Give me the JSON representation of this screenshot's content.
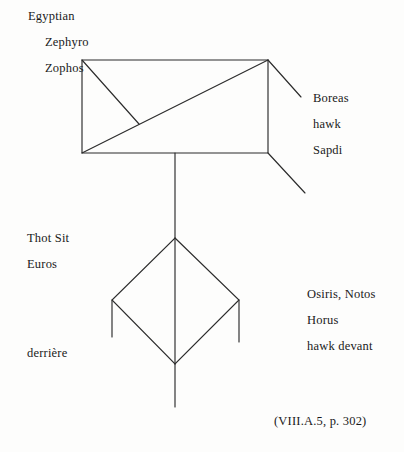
{
  "page": {
    "background_color": "#fdfdfc",
    "ink_color": "#2b2b2b",
    "text_color": "#1a1a1a"
  },
  "labels": {
    "top_left": [
      {
        "text": "Egyptian",
        "x": 28,
        "y": 10
      },
      {
        "text": "Zephyro",
        "x": 45,
        "y": 36
      },
      {
        "text": "Zophos",
        "x": 45,
        "y": 62
      }
    ],
    "right_upper": [
      {
        "text": "Boreas",
        "x": 313,
        "y": 92
      },
      {
        "text": "hawk",
        "x": 313,
        "y": 118
      },
      {
        "text": "Sapdi",
        "x": 313,
        "y": 144
      }
    ],
    "left_lower": [
      {
        "text": "Thot Sit",
        "x": 27,
        "y": 232
      },
      {
        "text": "Euros",
        "x": 27,
        "y": 258
      }
    ],
    "right_lower": [
      {
        "text": "Osiris, Notos",
        "x": 307,
        "y": 288
      },
      {
        "text": "Horus",
        "x": 307,
        "y": 314
      },
      {
        "text": "hawk devant",
        "x": 307,
        "y": 340
      }
    ],
    "bottom_left": [
      {
        "text": "derrière",
        "x": 27,
        "y": 347
      }
    ],
    "citation": {
      "text": "(VIII.A.5, p. 302)",
      "x": 274,
      "y": 414
    }
  },
  "chart_data": {
    "type": "diagram",
    "title": "",
    "stroke_color": "#2b2b2b",
    "stroke_width": 1.15,
    "shapes": [
      {
        "name": "upper-rectangle",
        "type": "polygon",
        "points": [
          [
            82,
            60
          ],
          [
            268,
            60
          ],
          [
            268,
            153
          ],
          [
            82,
            153
          ]
        ]
      },
      {
        "name": "rectangle-main-diagonal",
        "type": "line",
        "points": [
          [
            82,
            153
          ],
          [
            268,
            60
          ]
        ]
      },
      {
        "name": "rectangle-short-diagonal",
        "type": "line",
        "points": [
          [
            82,
            60
          ],
          [
            139,
            124
          ]
        ]
      },
      {
        "name": "top-right-ray",
        "type": "line",
        "points": [
          [
            268,
            60
          ],
          [
            301,
            97
          ]
        ]
      },
      {
        "name": "bottom-right-ray",
        "type": "line",
        "points": [
          [
            268,
            153
          ],
          [
            305,
            193
          ]
        ]
      },
      {
        "name": "vertical-stem-upper",
        "type": "line",
        "points": [
          [
            175,
            153
          ],
          [
            175,
            238
          ]
        ]
      },
      {
        "name": "lower-diamond",
        "type": "polygon",
        "points": [
          [
            175,
            238
          ],
          [
            239,
            300
          ],
          [
            175,
            364
          ],
          [
            112,
            300
          ]
        ]
      },
      {
        "name": "diamond-axis",
        "type": "line",
        "points": [
          [
            175,
            238
          ],
          [
            175,
            364
          ]
        ]
      },
      {
        "name": "diamond-left-stub",
        "type": "line",
        "points": [
          [
            112,
            300
          ],
          [
            112,
            337
          ]
        ]
      },
      {
        "name": "diamond-right-stub",
        "type": "line",
        "points": [
          [
            239,
            300
          ],
          [
            239,
            342
          ]
        ]
      },
      {
        "name": "vertical-stem-lower",
        "type": "line",
        "points": [
          [
            175,
            364
          ],
          [
            175,
            407
          ]
        ]
      }
    ]
  }
}
